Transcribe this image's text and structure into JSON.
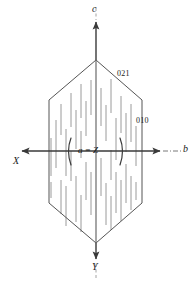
{
  "figure": {
    "kind": "crystal-habit-diagram",
    "background_color": "#ffffff",
    "outline_color": "#555555",
    "axis_color": "#3a3a3a",
    "striation_color": "#9a9a9a",
    "label_color": "#1a1a1a"
  },
  "axes": {
    "vertical_top": {
      "label": "c",
      "italic": true
    },
    "vertical_bottom": {
      "label": "Y",
      "italic": true
    },
    "horizontal_left": {
      "label": "X",
      "italic": true
    },
    "horizontal_right": {
      "label": "b",
      "italic": true
    }
  },
  "center": {
    "label": "a = Z"
  },
  "faces": [
    {
      "index": "021",
      "label": "021"
    },
    {
      "index": "010",
      "label": "010"
    }
  ],
  "crystal": {
    "vertices": [
      [
        96,
        60
      ],
      [
        142,
        100
      ],
      [
        142,
        203
      ],
      [
        96,
        243
      ],
      [
        49,
        203
      ],
      [
        49,
        100
      ]
    ]
  }
}
